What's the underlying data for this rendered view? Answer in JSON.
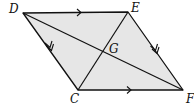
{
  "diagram": {
    "type": "parallelogram",
    "fill_color": "#e6e6e6",
    "stroke_color": "#111111",
    "vertices": {
      "D": {
        "label": "D",
        "x": 23,
        "y": 13,
        "label_x": 9,
        "label_y": 13
      },
      "E": {
        "label": "E",
        "x": 128,
        "y": 12,
        "label_x": 131,
        "label_y": 12
      },
      "C": {
        "label": "C",
        "x": 78,
        "y": 90,
        "label_x": 70,
        "label_y": 103
      },
      "F": {
        "label": "F",
        "x": 183,
        "y": 90,
        "label_x": 186,
        "label_y": 103
      }
    },
    "intersection": {
      "label": "G",
      "x": 103,
      "y": 51,
      "label_x": 109,
      "label_y": 53
    },
    "sides": [
      {
        "from": "D",
        "to": "E",
        "arrow": "single"
      },
      {
        "from": "C",
        "to": "F",
        "arrow": "single"
      },
      {
        "from": "D",
        "to": "C",
        "arrow": "double"
      },
      {
        "from": "E",
        "to": "F",
        "arrow": "double"
      }
    ],
    "diagonals": [
      {
        "from": "D",
        "to": "F"
      },
      {
        "from": "E",
        "to": "C"
      }
    ]
  }
}
